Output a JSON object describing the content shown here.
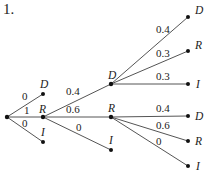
{
  "title": "1.",
  "tree": {
    "root": {
      "x": 7,
      "y": 117
    },
    "level1": [
      {
        "label": "D",
        "prob": "0",
        "x": 43,
        "y": 94
      },
      {
        "label": "R",
        "prob": "1",
        "x": 43,
        "y": 117
      },
      {
        "label": "I",
        "prob": "0",
        "x": 43,
        "y": 142
      }
    ],
    "level2": [
      {
        "label": "D",
        "prob": "0.4",
        "x": 111,
        "y": 84
      },
      {
        "label": "R",
        "prob": "0.6",
        "x": 111,
        "y": 117
      },
      {
        "label": "I",
        "prob": "0",
        "x": 111,
        "y": 150
      }
    ],
    "level3_from_D": [
      {
        "label": "D",
        "prob": "0.4",
        "x": 188,
        "y": 17
      },
      {
        "label": "R",
        "prob": "0.3",
        "x": 188,
        "y": 51
      },
      {
        "label": "I",
        "prob": "0.3",
        "x": 188,
        "y": 84
      }
    ],
    "level3_from_R": [
      {
        "label": "D",
        "prob": "0.4",
        "x": 188,
        "y": 116
      },
      {
        "label": "R",
        "prob": "0.6",
        "x": 188,
        "y": 141
      },
      {
        "label": "I",
        "prob": "0",
        "x": 188,
        "y": 166
      }
    ]
  }
}
